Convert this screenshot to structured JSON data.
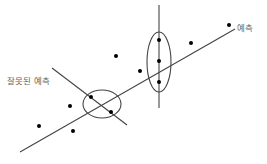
{
  "diagram": {
    "type": "regression-illustration",
    "labels": {
      "prediction": "예측",
      "wrong_prediction": "잘못된 예측"
    },
    "caption_clipped": "",
    "colors": {
      "background": "#ffffff",
      "line": "#444444",
      "dot": "#000000",
      "label": "#666666"
    },
    "regression_line": {
      "x1": 20,
      "y1": 152,
      "x2": 235,
      "y2": 29
    },
    "wrong_prediction_line": {
      "x1": 52,
      "y1": 68,
      "x2": 127,
      "y2": 125
    },
    "vertical_line": {
      "x1": 159,
      "y1": 5,
      "x2": 159,
      "y2": 108
    },
    "ellipses": [
      {
        "name": "right-cluster",
        "cx": 159,
        "cy": 62,
        "rx": 12,
        "ry": 30
      },
      {
        "name": "left-cluster",
        "cx": 102,
        "cy": 104,
        "rx": 19,
        "ry": 14
      }
    ],
    "points": [
      {
        "x": 116,
        "y": 56
      },
      {
        "x": 191,
        "y": 43
      },
      {
        "x": 229,
        "y": 25
      },
      {
        "x": 140,
        "y": 71
      },
      {
        "x": 159,
        "y": 40
      },
      {
        "x": 159,
        "y": 61
      },
      {
        "x": 159,
        "y": 82
      },
      {
        "x": 91,
        "y": 97
      },
      {
        "x": 111,
        "y": 112
      },
      {
        "x": 70,
        "y": 106
      },
      {
        "x": 39,
        "y": 126
      },
      {
        "x": 73,
        "y": 131
      }
    ]
  }
}
